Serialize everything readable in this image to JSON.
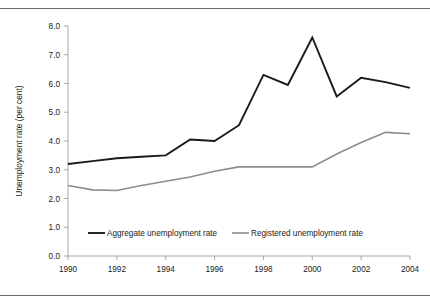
{
  "chart_data": {
    "type": "line",
    "title": "",
    "xlabel": "",
    "ylabel": "Unemployment rate (per cent)",
    "x": [
      1990,
      1991,
      1992,
      1993,
      1994,
      1995,
      1996,
      1997,
      1998,
      1999,
      2000,
      2001,
      2002,
      2003,
      2004
    ],
    "xtick_labels": [
      "1990",
      "1992",
      "1994",
      "1996",
      "1998",
      "2000",
      "2002",
      "2004"
    ],
    "xtick_values": [
      1990,
      1992,
      1994,
      1996,
      1998,
      2000,
      2002,
      2004
    ],
    "xlim": [
      1990,
      2004
    ],
    "ytick_labels": [
      "0.0",
      "1.0",
      "2.0",
      "3.0",
      "4.0",
      "5.0",
      "6.0",
      "7.0",
      "8.0"
    ],
    "ytick_values": [
      0,
      1,
      2,
      3,
      4,
      5,
      6,
      7,
      8
    ],
    "ylim": [
      0,
      8
    ],
    "grid": false,
    "legend_position": "bottom-center",
    "series": [
      {
        "name": "Aggregate unemployment rate",
        "color": "#1a1a1a",
        "width": 1.9,
        "values": [
          3.2,
          3.3,
          3.4,
          3.45,
          3.5,
          4.05,
          4.0,
          4.55,
          6.3,
          5.95,
          7.6,
          5.55,
          6.2,
          6.05,
          5.85
        ]
      },
      {
        "name": "Registered unemployment rate",
        "color": "#8c8c8c",
        "width": 1.6,
        "values": [
          2.45,
          2.3,
          2.28,
          2.45,
          2.6,
          2.75,
          2.95,
          3.1,
          3.1,
          3.1,
          3.1,
          3.55,
          3.95,
          4.3,
          4.25
        ]
      }
    ]
  },
  "legend": {
    "items": [
      {
        "label": "Aggregate unemployment rate",
        "color": "#1a1a1a"
      },
      {
        "label": "Registered unemployment rate",
        "color": "#8c8c8c"
      }
    ]
  },
  "axes": {
    "y_title": "Unemployment rate (per cent)"
  }
}
